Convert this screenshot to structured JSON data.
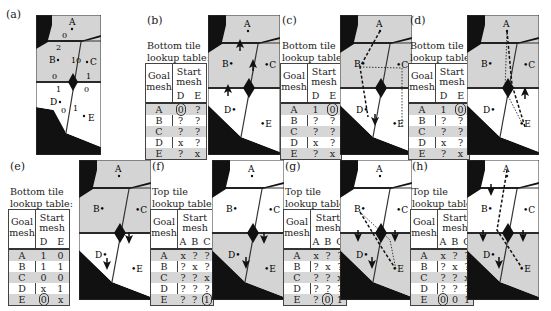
{
  "figure": {
    "panels": [
      {
        "id": "a",
        "label": "(a)"
      },
      {
        "id": "b",
        "label": "(b)",
        "caption": [
          "Bottom tile",
          "lookup table:"
        ],
        "header": {
          "goal": [
            "Goal",
            "mesh"
          ],
          "start": [
            "Start",
            "mesh"
          ],
          "cols": [
            "D",
            "E"
          ]
        },
        "rows": [
          {
            "goal": "A",
            "vals": [
              "0",
              "?"
            ],
            "circled": 0
          },
          {
            "goal": "B",
            "vals": [
              "?",
              "?"
            ]
          },
          {
            "goal": "C",
            "vals": [
              "?",
              "?"
            ]
          },
          {
            "goal": "D",
            "vals": [
              "x",
              "?"
            ]
          },
          {
            "goal": "E",
            "vals": [
              "?",
              "x"
            ]
          }
        ]
      },
      {
        "id": "c",
        "label": "(c)",
        "caption": [
          "Bottom tile",
          "lookup table:"
        ],
        "header": {
          "goal": [
            "Goal",
            "mesh"
          ],
          "start": [
            "Start",
            "mesh"
          ],
          "cols": [
            "D",
            "E"
          ]
        },
        "rows": [
          {
            "goal": "A",
            "vals": [
              "1",
              "0"
            ],
            "circled": 1
          },
          {
            "goal": "B",
            "vals": [
              "?",
              "?"
            ]
          },
          {
            "goal": "C",
            "vals": [
              "?",
              "?"
            ]
          },
          {
            "goal": "D",
            "vals": [
              "x",
              "?"
            ]
          },
          {
            "goal": "E",
            "vals": [
              "?",
              "x"
            ]
          }
        ]
      },
      {
        "id": "d",
        "label": "(d)",
        "caption": [
          "Bottom tile",
          "lookup table:"
        ],
        "header": {
          "goal": [
            "Goal",
            "mesh"
          ],
          "start": [
            "Start",
            "mesh"
          ],
          "cols": [
            "D",
            "E"
          ]
        },
        "rows": [
          {
            "goal": "A",
            "vals": [
              "1",
              "0"
            ],
            "circled": 1
          },
          {
            "goal": "B",
            "vals": [
              "?",
              "?"
            ]
          },
          {
            "goal": "C",
            "vals": [
              "?",
              "?"
            ]
          },
          {
            "goal": "D",
            "vals": [
              "x",
              "?"
            ]
          },
          {
            "goal": "E",
            "vals": [
              "?",
              "x"
            ]
          }
        ]
      },
      {
        "id": "e",
        "label": "(e)",
        "caption": [
          "Bottom tile",
          "lookup table:"
        ],
        "header": {
          "goal": [
            "Goal",
            "mesh"
          ],
          "start": [
            "Start",
            "mesh"
          ],
          "cols": [
            "D",
            "E"
          ]
        },
        "rows": [
          {
            "goal": "A",
            "vals": [
              "1",
              "0"
            ]
          },
          {
            "goal": "B",
            "vals": [
              "1",
              "1"
            ]
          },
          {
            "goal": "C",
            "vals": [
              "0",
              "0"
            ]
          },
          {
            "goal": "D",
            "vals": [
              "x",
              "1"
            ]
          },
          {
            "goal": "E",
            "vals": [
              "0",
              "x"
            ],
            "circled": 0
          }
        ]
      },
      {
        "id": "f",
        "label": "(f)",
        "caption": [
          "Top tile",
          "lookup table:"
        ],
        "header": {
          "goal": [
            "Goal",
            "mesh"
          ],
          "start": [
            "Start",
            "mesh"
          ],
          "cols": [
            "A",
            "B",
            "C"
          ]
        },
        "rows": [
          {
            "goal": "A",
            "vals": [
              "x",
              "?",
              "?"
            ]
          },
          {
            "goal": "B",
            "vals": [
              "?",
              "x",
              "?"
            ]
          },
          {
            "goal": "C",
            "vals": [
              "?",
              "?",
              "x"
            ]
          },
          {
            "goal": "D",
            "vals": [
              "?",
              "?",
              "?"
            ]
          },
          {
            "goal": "E",
            "vals": [
              "?",
              "?",
              "1"
            ],
            "circled": 2
          }
        ]
      },
      {
        "id": "g",
        "label": "(g)",
        "caption": [
          "Top tile",
          "lookup table:"
        ],
        "header": {
          "goal": [
            "Goal",
            "mesh"
          ],
          "start": [
            "Start",
            "mesh"
          ],
          "cols": [
            "A",
            "B",
            "C"
          ]
        },
        "rows": [
          {
            "goal": "A",
            "vals": [
              "x",
              "?",
              "?"
            ]
          },
          {
            "goal": "B",
            "vals": [
              "?",
              "x",
              "?"
            ]
          },
          {
            "goal": "C",
            "vals": [
              "?",
              "?",
              "x"
            ]
          },
          {
            "goal": "D",
            "vals": [
              "?",
              "?",
              "?"
            ]
          },
          {
            "goal": "E",
            "vals": [
              "?",
              "0",
              "1"
            ],
            "circled": 1
          }
        ]
      },
      {
        "id": "h",
        "label": "(h)",
        "caption": [
          "Top tile",
          "lookup table:"
        ],
        "header": {
          "goal": [
            "Goal",
            "mesh"
          ],
          "start": [
            "Start",
            "mesh"
          ],
          "cols": [
            "A",
            "B",
            "C"
          ]
        },
        "rows": [
          {
            "goal": "A",
            "vals": [
              "x",
              "?",
              "?"
            ]
          },
          {
            "goal": "B",
            "vals": [
              "?",
              "x",
              "?"
            ]
          },
          {
            "goal": "C",
            "vals": [
              "?",
              "?",
              "x"
            ]
          },
          {
            "goal": "D",
            "vals": [
              "?",
              "?",
              "?"
            ]
          },
          {
            "goal": "E",
            "vals": [
              "0",
              "0",
              "1"
            ],
            "circled": 0
          }
        ]
      }
    ],
    "mesh_labels": {
      "A": "A",
      "B": "B",
      "C": "C",
      "D": "D",
      "E": "E"
    },
    "panel_a_portal_ids": [
      "0",
      "2",
      "1",
      "0",
      "0",
      "1",
      "1",
      "0",
      "0",
      "1"
    ],
    "colors": {
      "gray_region": "#d4d4d4",
      "white_region": "#ffffff",
      "obstacle": "#111111",
      "border": "#333333",
      "row_shade": "#d6d6d6"
    }
  }
}
